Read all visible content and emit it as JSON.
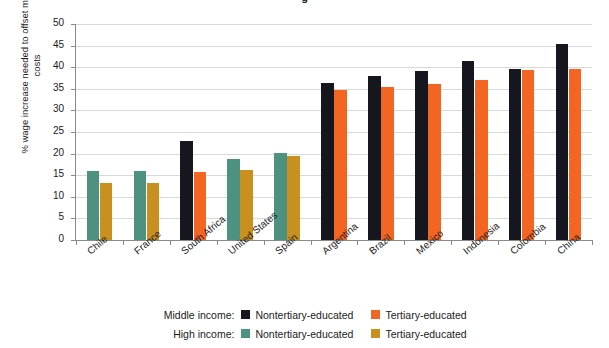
{
  "title_fragment": "g",
  "axis": {
    "ylabel": "% wage increase needed to offset moving costs",
    "yticks": [
      "0",
      "5",
      "10",
      "15",
      "20",
      "25",
      "30",
      "35",
      "40",
      "45",
      "50"
    ]
  },
  "legend": {
    "rows": [
      {
        "group_label": "Middle income:",
        "items": [
          {
            "label": "Nontertiary-educated",
            "color": "#16161e",
            "name": "middle-nontertiary"
          },
          {
            "label": "Tertiary-educated",
            "color": "#f26522",
            "name": "middle-tertiary"
          }
        ]
      },
      {
        "group_label": "High income:",
        "items": [
          {
            "label": "Nontertiary-educated",
            "color": "#4d9181",
            "name": "high-nontertiary"
          },
          {
            "label": "Tertiary-educated",
            "color": "#c8901e",
            "name": "high-tertiary"
          }
        ]
      }
    ]
  },
  "chart_data": {
    "type": "bar",
    "title": "",
    "xlabel": "",
    "ylabel": "% wage increase needed to offset moving costs",
    "ylim": [
      0,
      50
    ],
    "ytick_step": 5,
    "grid": true,
    "legend_position": "bottom",
    "categories": [
      "Chile",
      "France",
      "South Africa",
      "United States",
      "Spain",
      "Argentina",
      "Brazil",
      "Mexico",
      "Indonesia",
      "Colombia",
      "China"
    ],
    "income_group": [
      "High",
      "High",
      "Middle",
      "High",
      "High",
      "Middle",
      "Middle",
      "Middle",
      "Middle",
      "Middle",
      "Middle"
    ],
    "series": [
      {
        "name": "Nontertiary-educated",
        "values": [
          16.0,
          16.0,
          22.9,
          18.8,
          20.2,
          36.3,
          38.0,
          39.1,
          41.4,
          39.6,
          45.4
        ],
        "colors": [
          "#4d9181",
          "#4d9181",
          "#16161e",
          "#4d9181",
          "#4d9181",
          "#16161e",
          "#16161e",
          "#16161e",
          "#16161e",
          "#16161e",
          "#16161e"
        ]
      },
      {
        "name": "Tertiary-educated",
        "values": [
          13.2,
          13.2,
          15.8,
          16.2,
          19.4,
          34.8,
          35.5,
          36.2,
          37.0,
          39.4,
          39.6
        ],
        "colors": [
          "#c8901e",
          "#c8901e",
          "#f26522",
          "#c8901e",
          "#c8901e",
          "#f26522",
          "#f26522",
          "#f26522",
          "#f26522",
          "#f26522",
          "#f26522"
        ]
      }
    ]
  }
}
